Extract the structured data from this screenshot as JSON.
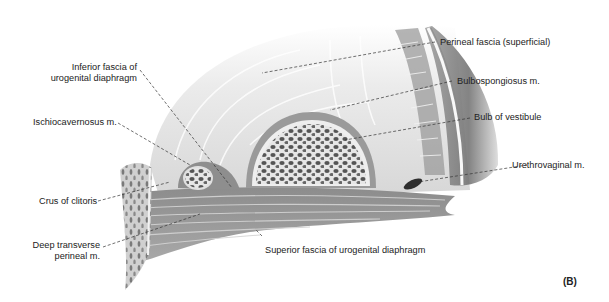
{
  "figure": {
    "panel_label": "(B)",
    "labels": {
      "inferior_fascia_line1": "Inferior fascia of",
      "inferior_fascia_line2": "urogenital diaphragm",
      "ischiocavernosus": "Ischiocavernosus m.",
      "crus_of_clitoris": "Crus of clitoris",
      "deep_transverse_line1": "Deep transverse",
      "deep_transverse_line2": "perineal m.",
      "perineal_fascia": "Perineal fascia (superficial)",
      "bulbospongiosus": "Bulbospongiosus m.",
      "bulb_of_vestibule": "Bulb of vestibule",
      "urethrovaginal": "Urethrovaginal m.",
      "superior_fascia": "Superior fascia of urogenital diaphragm"
    }
  }
}
